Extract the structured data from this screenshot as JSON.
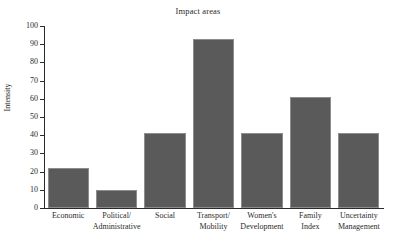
{
  "chart_data": {
    "type": "bar",
    "title": "Impact areas",
    "xlabel": "",
    "ylabel": "Intensity",
    "categories": [
      "Economic",
      "Political/ Administrative",
      "Social",
      "Transport/ Mobility",
      "Women's Development",
      "Family Index",
      "Uncertainty Management"
    ],
    "category_lines": [
      [
        "Economic"
      ],
      [
        "Political/",
        "Administrative"
      ],
      [
        "Social"
      ],
      [
        "Transport/",
        "Mobility"
      ],
      [
        "Women's",
        "Development"
      ],
      [
        "Family",
        "Index"
      ],
      [
        "Uncertainty",
        "Management"
      ]
    ],
    "values": [
      22,
      10,
      41,
      93,
      41,
      61,
      41
    ],
    "ylim": [
      0,
      100
    ],
    "yticks": [
      0,
      10,
      20,
      30,
      40,
      50,
      60,
      70,
      80,
      90,
      100
    ],
    "ytick_labels": [
      "0",
      "10",
      "20",
      "30",
      "40",
      "50",
      "60",
      "70",
      "80",
      "90",
      "100"
    ],
    "grid": false,
    "legend": false,
    "bar_color": "#5a5a5a",
    "bar_edge_color": "#8d8d8d",
    "axis_color": "#2b2b2b"
  }
}
